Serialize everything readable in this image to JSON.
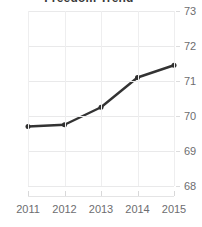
{
  "chart_data": {
    "type": "line",
    "title": "Freedom Trend",
    "xlabel": "",
    "ylabel": "",
    "categories": [
      "2011",
      "2012",
      "2013",
      "2014",
      "2015"
    ],
    "values": [
      69.7,
      69.75,
      70.25,
      71.1,
      71.45
    ],
    "series": [
      {
        "name": "Freedom Trend",
        "values": [
          69.7,
          69.75,
          70.25,
          71.1,
          71.45
        ],
        "color": "#333333",
        "marker": "circle"
      }
    ],
    "ylim": [
      68,
      73
    ],
    "yticks": [
      68,
      69,
      70,
      71,
      72,
      73
    ],
    "ytick_labels": [
      "68",
      "69",
      "70",
      "71",
      "72",
      "73"
    ],
    "xticks": [
      "2011",
      "2012",
      "2013",
      "2014",
      "2015"
    ],
    "y_axis_position": "right",
    "grid": true,
    "grid_horizontal": true,
    "grid_vertical": true,
    "legend": false,
    "legend_position": "none",
    "title_clipped": true,
    "colors": {
      "line": "#333333",
      "marker": "#2f2f2f",
      "grid": "#e9e9ea",
      "tick_label": "#6d6d70",
      "title": "#3a3a3a",
      "background": "#ffffff"
    }
  }
}
